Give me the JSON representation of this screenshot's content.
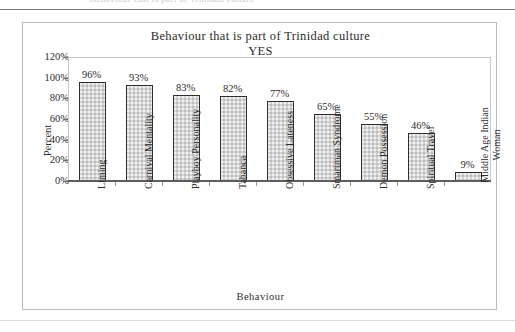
{
  "scan": {
    "top_ghost_text": "Behaviour that is part of Trinidad culture",
    "top_rule": "horizontal-rule",
    "bottom_rule": "horizontal-rule"
  },
  "chart_data": {
    "type": "bar",
    "title": "Behaviour that is part of Trinidad culture",
    "subtitle": "YES",
    "xlabel": "Behaviour",
    "ylabel": "Percent",
    "ylim": [
      0,
      120
    ],
    "ytick_labels": [
      "120%",
      "100%",
      "80%",
      "60%",
      "40%",
      "20%",
      "0%"
    ],
    "ytick_values": [
      120,
      100,
      80,
      60,
      40,
      20,
      0
    ],
    "grid": false,
    "legend": "none",
    "categories": [
      "Liming",
      "Carnival Mentality",
      "Playboy Personality",
      "Tabanca",
      "Obsessive Lateness",
      "Smartman Syndrome",
      "Demon Possession",
      "Spiritual Travel",
      "Middle Age Indian Woman"
    ],
    "values": [
      96,
      93,
      83,
      82,
      77,
      65,
      55,
      46,
      9
    ],
    "data_labels": [
      "96%",
      "93%",
      "83%",
      "82%",
      "77%",
      "65%",
      "55%",
      "46%",
      "9%"
    ],
    "bar_fill": "#d4d4d4",
    "bar_border": "#2e2e2e"
  }
}
